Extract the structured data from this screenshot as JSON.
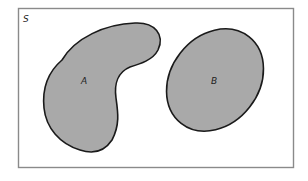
{
  "diagram": {
    "type": "venn",
    "sample_space": {
      "label": "S",
      "border_color": "#8a8a8a",
      "fill": "#ffffff"
    },
    "sets": [
      {
        "label": "A",
        "shape": "kidney",
        "fill": "#a9a9a9",
        "stroke": "#1a1a1a"
      },
      {
        "label": "B",
        "shape": "ellipse",
        "fill": "#a9a9a9",
        "stroke": "#1a1a1a"
      }
    ],
    "relationship": "disjoint"
  }
}
